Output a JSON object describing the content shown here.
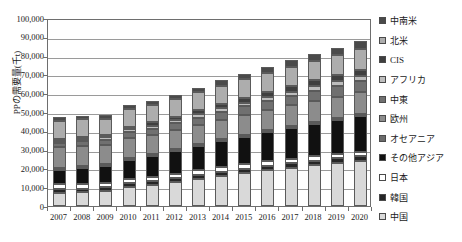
{
  "chart_data": {
    "type": "bar",
    "stacked": true,
    "title": "",
    "xlabel": "",
    "ylabel": "PPの需要量(千t)",
    "ylim": [
      0,
      100000
    ],
    "ytick_step": 10000,
    "ytick_labels": [
      "100,000",
      "90,000",
      "80,000",
      "70,000",
      "60,000",
      "50,000",
      "40,000",
      "30,000",
      "20,000",
      "10,000",
      "0"
    ],
    "grid": true,
    "legend_position": "right",
    "categories": [
      "2007",
      "2008",
      "2009",
      "2010",
      "2011",
      "2012",
      "2013",
      "2014",
      "2015",
      "2016",
      "2017",
      "2018",
      "2019",
      "2020"
    ],
    "series": [
      {
        "name": "中国",
        "color": "#d9d9d9",
        "values": [
          7000,
          7400,
          8100,
          10000,
          11200,
          12800,
          14500,
          16100,
          17600,
          19100,
          20400,
          21700,
          22900,
          24100
        ]
      },
      {
        "name": "韓国",
        "color": "#262626",
        "values": [
          1900,
          1900,
          1900,
          2000,
          2000,
          2100,
          2100,
          2200,
          2200,
          2300,
          2300,
          2400,
          2400,
          2500
        ]
      },
      {
        "name": "日本",
        "color": "#ffffff",
        "values": [
          2600,
          2500,
          2300,
          2500,
          2400,
          2400,
          2400,
          2400,
          2400,
          2400,
          2400,
          2400,
          2400,
          2400
        ]
      },
      {
        "name": "その他アジア",
        "color": "#111111",
        "values": [
          7800,
          8300,
          9000,
          10200,
          10900,
          11900,
          12800,
          13700,
          14600,
          15500,
          16300,
          17100,
          17900,
          18700
        ]
      },
      {
        "name": "オセアニア",
        "color": "#6b6b6b",
        "values": [
          400,
          400,
          400,
          400,
          400,
          400,
          450,
          450,
          450,
          450,
          500,
          500,
          500,
          500
        ]
      },
      {
        "name": "欧州",
        "color": "#8c8c8c",
        "values": [
          10800,
          10700,
          10000,
          10500,
          10400,
          10200,
          10300,
          10500,
          10700,
          10900,
          11100,
          11300,
          11500,
          11700
        ]
      },
      {
        "name": "中東",
        "color": "#707070",
        "values": [
          2400,
          2600,
          2800,
          3000,
          3200,
          3500,
          3800,
          4100,
          4400,
          4700,
          5000,
          5300,
          5600,
          5900
        ]
      },
      {
        "name": "アフリカ",
        "color": "#bdbdbd",
        "values": [
          1200,
          1300,
          1400,
          1500,
          1600,
          1700,
          1800,
          1900,
          2000,
          2150,
          2300,
          2450,
          2600,
          2750
        ]
      },
      {
        "name": "CIS",
        "color": "#3f3f3f",
        "values": [
          1100,
          1200,
          1300,
          1500,
          1700,
          1900,
          2100,
          2300,
          2500,
          2700,
          2900,
          3100,
          3300,
          3500
        ]
      },
      {
        "name": "北米",
        "color": "#adadad",
        "values": [
          9500,
          9300,
          8600,
          9200,
          9300,
          9400,
          9600,
          9800,
          10000,
          10200,
          10400,
          10600,
          10800,
          11000
        ]
      },
      {
        "name": "中南米",
        "color": "#4a4a4a",
        "values": [
          1800,
          1900,
          1900,
          2100,
          2200,
          2400,
          2600,
          2800,
          3000,
          3200,
          3400,
          3600,
          3800,
          4000
        ]
      }
    ],
    "legend_order_top_to_bottom": [
      "中南米",
      "北米",
      "CIS",
      "アフリカ",
      "中東",
      "欧州",
      "オセアニア",
      "その他アジア",
      "日本",
      "韓国",
      "中国"
    ]
  }
}
